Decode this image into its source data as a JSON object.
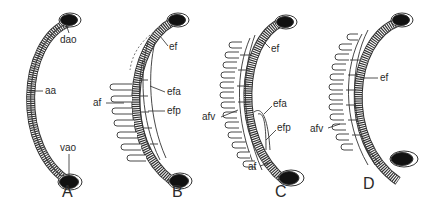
{
  "figure": {
    "type": "anatomical-diagram",
    "panels": [
      {
        "id": "A",
        "label": "A",
        "annotations": [
          {
            "key": "dao",
            "text": "dao"
          },
          {
            "key": "aa",
            "text": "aa"
          },
          {
            "key": "vao",
            "text": "vao"
          }
        ]
      },
      {
        "id": "B",
        "label": "B",
        "annotations": [
          {
            "key": "ef",
            "text": "ef"
          },
          {
            "key": "efa",
            "text": "efa"
          },
          {
            "key": "af",
            "text": "af"
          },
          {
            "key": "efp",
            "text": "efp"
          }
        ]
      },
      {
        "id": "C",
        "label": "C",
        "annotations": [
          {
            "key": "ef",
            "text": "ef"
          },
          {
            "key": "afv",
            "text": "afv"
          },
          {
            "key": "efa",
            "text": "efa"
          },
          {
            "key": "efp",
            "text": "efp"
          },
          {
            "key": "af",
            "text": "af"
          }
        ]
      },
      {
        "id": "D",
        "label": "D",
        "annotations": [
          {
            "key": "ef",
            "text": "ef"
          },
          {
            "key": "afv",
            "text": "afv"
          }
        ]
      }
    ],
    "colors": {
      "background": "#ffffff",
      "ink": "#2a2a2a",
      "vessel_fill": "#111111"
    }
  }
}
